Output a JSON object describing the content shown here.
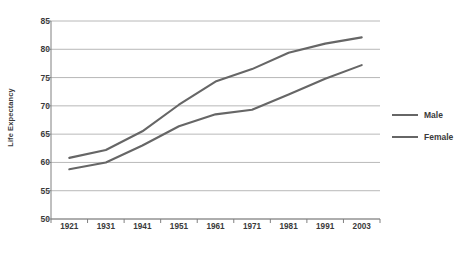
{
  "chart_data": {
    "type": "line",
    "title": "",
    "xlabel": "",
    "ylabel": "Life Expectancy",
    "categories": [
      "1921",
      "1931",
      "1941",
      "1951",
      "1961",
      "1971",
      "1981",
      "1991",
      "2003"
    ],
    "ylim": [
      50,
      85
    ],
    "yticks": [
      50,
      55,
      60,
      65,
      70,
      75,
      80,
      85
    ],
    "grid": "horizontal",
    "legend_position": "right",
    "series": [
      {
        "name": "Male",
        "color": "#666666",
        "values": [
          58.8,
          60.0,
          63.0,
          66.4,
          68.5,
          69.3,
          72.0,
          74.8,
          77.2
        ]
      },
      {
        "name": "Female",
        "color": "#666666",
        "values": [
          60.8,
          62.2,
          65.5,
          70.2,
          74.3,
          76.5,
          79.4,
          81.0,
          82.1
        ]
      }
    ]
  },
  "axis": {
    "y_title": "Life Expectancy",
    "y_tick_labels": [
      "85",
      "80",
      "75",
      "70",
      "65",
      "60",
      "55",
      "50"
    ],
    "x_tick_labels": [
      "1921",
      "1931",
      "1941",
      "1951",
      "1961",
      "1971",
      "1981",
      "1991",
      "2003"
    ]
  },
  "legend": {
    "items": [
      {
        "label": "Male"
      },
      {
        "label": "Female"
      }
    ]
  },
  "caption": {
    "text": ""
  },
  "colors": {
    "line": "#666666",
    "grid": "#a6a6a6",
    "axis": "#808080",
    "text": "#3a3a3a"
  }
}
